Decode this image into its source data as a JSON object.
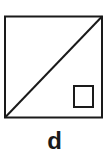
{
  "figure": {
    "label": "d",
    "shapes": {
      "outer_square": {
        "x": 5,
        "y": 16,
        "w": 97,
        "h": 101
      },
      "diagonal": {
        "x1": 5,
        "y1": 117,
        "x2": 102,
        "y2": 16
      },
      "right_angle_marker": {
        "x": 74,
        "y": 86,
        "w": 19,
        "h": 21
      }
    },
    "stroke_color": "#1a1a1a"
  }
}
